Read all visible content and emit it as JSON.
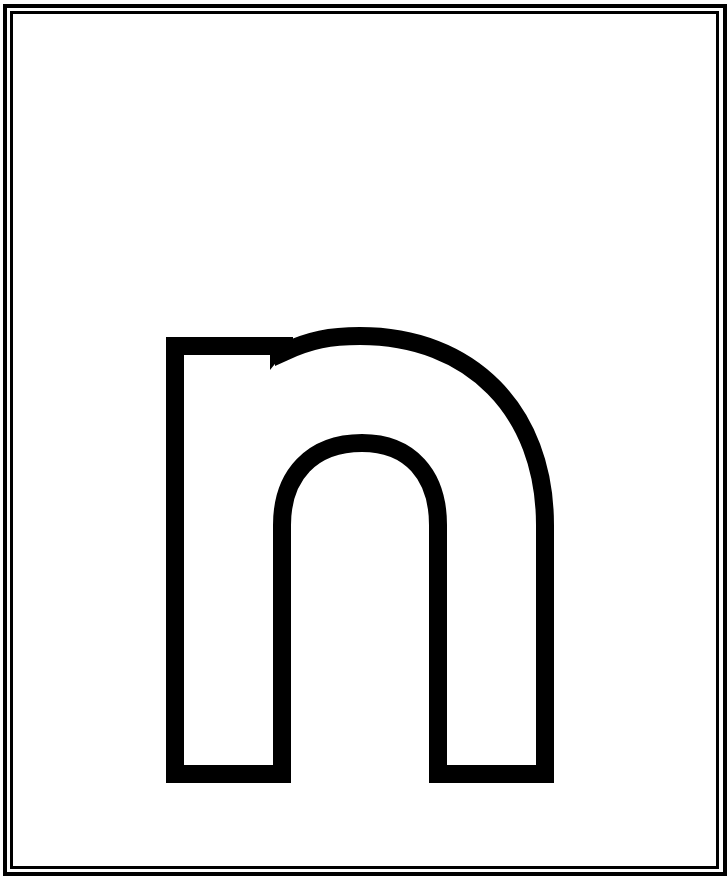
{
  "worksheet": {
    "letter": "n",
    "letter_case": "lowercase",
    "style": "outline",
    "stroke_color": "#000000",
    "fill_color": "#ffffff",
    "background_color": "#ffffff",
    "border": {
      "type": "double",
      "color": "#000000"
    }
  }
}
